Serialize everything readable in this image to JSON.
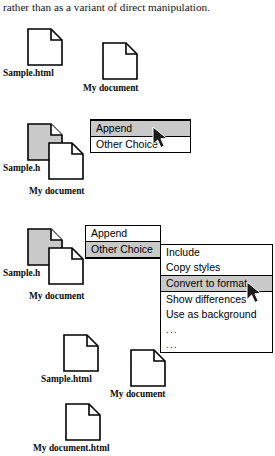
{
  "caption": {
    "text": "rather than as a variant of direct manipulation."
  },
  "colors": {
    "highlight": "#c9c9c9",
    "selected_doc_fill": "#c9c9c9",
    "doc_fill": "#ffffff",
    "outline": "#000000"
  },
  "labels": {
    "sample_html": "Sample.html",
    "sample_truncated": "Sample.h",
    "my_document": "My document",
    "my_document_html": "My document.html"
  },
  "step1": {
    "docs": [
      {
        "label": "Sample.html",
        "selected": false
      },
      {
        "label": "My document",
        "selected": false
      }
    ]
  },
  "step2": {
    "docs": [
      {
        "label": "Sample.h",
        "selected": true
      },
      {
        "label": "My document",
        "selected": false
      }
    ],
    "menu": {
      "items": [
        {
          "label": "Append",
          "highlighted": true
        },
        {
          "label": "Other Choice",
          "highlighted": false
        }
      ]
    }
  },
  "step3": {
    "docs": [
      {
        "label": "Sample.h",
        "selected": true
      },
      {
        "label": "My document",
        "selected": false
      }
    ],
    "menu": {
      "items": [
        {
          "label": "Append",
          "highlighted": false
        },
        {
          "label": "Other Choice",
          "highlighted": true
        }
      ]
    },
    "submenu": {
      "items": [
        {
          "label": "Include",
          "highlighted": false
        },
        {
          "label": "Copy styles",
          "highlighted": false
        },
        {
          "label": "Convert to format",
          "highlighted": true
        },
        {
          "label": "Show differences",
          "highlighted": false
        },
        {
          "label": "Use as background",
          "highlighted": false
        },
        {
          "label": "...",
          "highlighted": false
        },
        {
          "label": "...",
          "highlighted": false
        }
      ]
    }
  },
  "step4": {
    "docs": [
      {
        "label": "Sample.html",
        "selected": false
      },
      {
        "label": "My document",
        "selected": false
      },
      {
        "label": "My document.html",
        "selected": false
      }
    ]
  }
}
